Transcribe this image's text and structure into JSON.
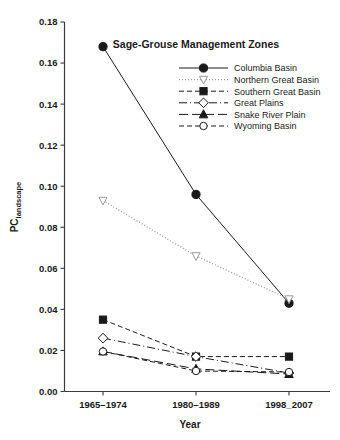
{
  "chart_data": {
    "type": "line",
    "title": "Sage-Grouse Management Zones",
    "xlabel": "Year",
    "ylabel": "PClandscape",
    "ylabel_base": "PC",
    "ylabel_subscript": "landscape",
    "categories": [
      "1965–1974",
      "1980–1989",
      "1998_2007"
    ],
    "ylim": [
      0.0,
      0.18
    ],
    "ytick_labels": [
      "0.00",
      "0.02",
      "0.04",
      "0.06",
      "0.08",
      "0.10",
      "0.12",
      "0.14",
      "0.16",
      "0.18"
    ],
    "ytick_values": [
      0.0,
      0.02,
      0.04,
      0.06,
      0.08,
      0.1,
      0.12,
      0.14,
      0.16,
      0.18
    ],
    "grid": false,
    "legend_position": "upper-right-inside",
    "series": [
      {
        "name": "Columbia Basin",
        "values": [
          0.168,
          0.096,
          0.043
        ],
        "marker": "filled-circle",
        "line_style": "solid",
        "color": "#1a1a1a"
      },
      {
        "name": "Northern Great Basin",
        "values": [
          0.093,
          0.066,
          0.045
        ],
        "marker": "open-triangle-down",
        "line_style": "dotted",
        "color": "#9a9a9a"
      },
      {
        "name": "Southern Great Basin",
        "values": [
          0.035,
          0.017,
          0.017
        ],
        "marker": "filled-square",
        "line_style": "dashed",
        "color": "#1a1a1a"
      },
      {
        "name": "Great Plains",
        "values": [
          0.026,
          0.017,
          0.009
        ],
        "marker": "open-diamond",
        "line_style": "dash-dot",
        "color": "#1a1a1a"
      },
      {
        "name": "Snake River Plain",
        "values": [
          0.0195,
          0.011,
          0.0085
        ],
        "marker": "filled-triangle-up",
        "line_style": "long-dash",
        "color": "#1a1a1a"
      },
      {
        "name": "Wyoming Basin",
        "values": [
          0.0195,
          0.01,
          0.0095
        ],
        "marker": "open-circle",
        "line_style": "dashed",
        "color": "#1a1a1a"
      }
    ]
  }
}
